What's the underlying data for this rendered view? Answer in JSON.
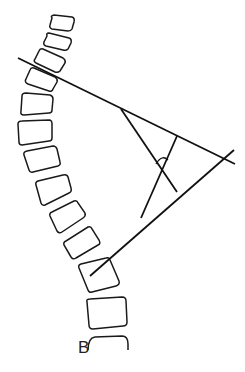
{
  "figure": {
    "label": "B",
    "vertebra_count": 13
  },
  "colors": {
    "background": "#ffffff",
    "stroke": "#111111"
  }
}
